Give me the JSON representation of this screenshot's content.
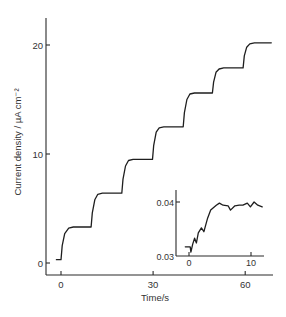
{
  "chart_data": [
    {
      "id": "main",
      "type": "line",
      "title": "",
      "xlabel": "Time/s",
      "ylabel": "Current density / µA cm⁻²",
      "xlim": [
        -5,
        69
      ],
      "ylim": [
        -1,
        22
      ],
      "xticks": [
        0,
        30,
        60
      ],
      "xtick_labels": [
        "0",
        "30",
        "60"
      ],
      "yticks": [
        0,
        10,
        20
      ],
      "ytick_labels": [
        "0",
        "10",
        "20"
      ],
      "grid": false,
      "legend": null,
      "series": [
        {
          "name": "current density",
          "x": [
            -1.5,
            0,
            0.4,
            1.2,
            2.5,
            4,
            9.8,
            10.2,
            11,
            12,
            13.5,
            19.8,
            20.2,
            21,
            22,
            23.5,
            29.8,
            30.2,
            31,
            32,
            33.5,
            39.8,
            40.2,
            41,
            42,
            43.5,
            49.3,
            49.7,
            50.5,
            51.5,
            53,
            59.3,
            59.7,
            60.5,
            61.5,
            63,
            68.5
          ],
          "y": [
            0.3,
            0.3,
            1.6,
            2.7,
            3.2,
            3.3,
            3.3,
            4.6,
            5.8,
            6.3,
            6.4,
            6.4,
            7.7,
            8.9,
            9.4,
            9.5,
            9.5,
            10.8,
            12.0,
            12.4,
            12.5,
            12.5,
            13.8,
            15.0,
            15.5,
            15.6,
            15.6,
            16.6,
            17.5,
            17.8,
            17.9,
            17.9,
            19.0,
            19.8,
            20.1,
            20.2,
            20.2
          ]
        }
      ],
      "step_plateaus": [
        0.3,
        3.3,
        6.4,
        9.5,
        12.5,
        15.6,
        17.9,
        20.2
      ],
      "step_times": [
        0,
        10,
        20,
        30,
        40,
        49.5,
        59.5
      ]
    },
    {
      "id": "inset",
      "type": "line",
      "title": "",
      "xlabel": "",
      "ylabel": "",
      "xlim": [
        -2.2,
        12.2
      ],
      "ylim": [
        0.03,
        0.0412
      ],
      "xticks": [
        0,
        10
      ],
      "xtick_labels": [
        "0",
        "10"
      ],
      "yticks": [
        0.03,
        0.04
      ],
      "ytick_labels": [
        "0.03",
        "0.04"
      ],
      "grid": false,
      "legend": null,
      "series": [
        {
          "name": "initial transient (zoom of first step)",
          "x": [
            -0.6,
            0.2,
            0.3,
            0.6,
            0.9,
            1.2,
            1.5,
            2.0,
            2.4,
            3.0,
            3.5,
            4.4,
            4.9,
            5.5,
            6.3,
            6.7,
            7.4,
            8.1,
            8.7,
            9.4,
            9.9,
            10.5,
            11.1,
            11.8
          ],
          "y": [
            0.0317,
            0.0317,
            0.0307,
            0.0322,
            0.0333,
            0.0324,
            0.0343,
            0.0352,
            0.0345,
            0.037,
            0.0385,
            0.0394,
            0.0398,
            0.0394,
            0.0393,
            0.0385,
            0.0393,
            0.0394,
            0.0394,
            0.0398,
            0.0391,
            0.04,
            0.0394,
            0.0391
          ]
        }
      ]
    }
  ],
  "layout": {
    "main_plot": {
      "x0": 61,
      "x_per_unit": 3.07,
      "y0": 263,
      "y_per_unit": 10.9,
      "axis_left": 46,
      "axis_bottom": 275,
      "axis_top": 18,
      "axis_right": 273
    },
    "inset_plot": {
      "x0": 189,
      "x_per_unit": 6.2,
      "y_base": 256,
      "y_base_value": 0.03,
      "y_per_unit": 5400,
      "axis_left": 176,
      "axis_bottom": 256,
      "axis_top": 190,
      "axis_right": 264
    }
  },
  "labels": {
    "xlabel": "Time/s",
    "ylabel": "Current density / µA cm⁻²"
  }
}
